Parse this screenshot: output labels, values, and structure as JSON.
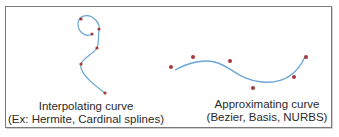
{
  "colors": {
    "curve": "#6aa6d4",
    "control_point": "#a33a3a",
    "border": "#7a7a7a",
    "text": "#2a2a2a"
  },
  "interpolating": {
    "title": "Interpolating curve",
    "subtitle": "(Ex: Hermite, Cardinal splines)",
    "points": [
      [
        81,
        19
      ],
      [
        92,
        34
      ],
      [
        99,
        29
      ],
      [
        97,
        48
      ],
      [
        81,
        64
      ],
      [
        105,
        93
      ]
    ]
  },
  "approximating": {
    "title": "Approximating curve",
    "subtitle": "(Bezier, Basis, NURBS)",
    "points": [
      [
        171,
        67
      ],
      [
        193,
        57
      ],
      [
        230,
        61
      ],
      [
        253,
        88
      ],
      [
        294,
        77
      ],
      [
        306,
        57
      ]
    ]
  }
}
